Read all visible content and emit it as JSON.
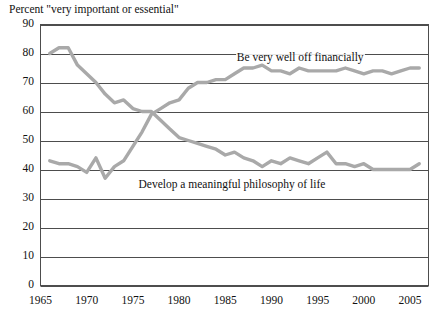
{
  "chart": {
    "title": "Percent \"very important or essential\"",
    "axis": {
      "y_ticks": [
        "0",
        "10",
        "20",
        "30",
        "40",
        "50",
        "60",
        "70",
        "80",
        "90"
      ],
      "x_ticks": [
        "1965",
        "1970",
        "1975",
        "1980",
        "1985",
        "1990",
        "1995",
        "2000",
        "2005"
      ]
    },
    "labels": {
      "financial": "Be very well off financially",
      "philosophy": "Develop a meaningful philosophy of life"
    },
    "colors": {
      "line": "#a9a9a9",
      "grid": "#4d4d4d",
      "border": "#4d4d4d",
      "text": "#111111",
      "background": "#ffffff"
    }
  },
  "chart_data": {
    "type": "line",
    "title": "Percent \"very important or essential\"",
    "xlabel": "",
    "ylabel": "",
    "xlim": [
      1965,
      2007
    ],
    "ylim": [
      0,
      90
    ],
    "grid": true,
    "legend": "inline-annotations",
    "x": [
      1966,
      1967,
      1968,
      1969,
      1970,
      1971,
      1972,
      1973,
      1974,
      1975,
      1976,
      1977,
      1978,
      1979,
      1980,
      1981,
      1982,
      1983,
      1984,
      1985,
      1986,
      1987,
      1988,
      1989,
      1990,
      1991,
      1992,
      1993,
      1994,
      1995,
      1996,
      1997,
      1998,
      1999,
      2000,
      2001,
      2002,
      2003,
      2004,
      2005,
      2006
    ],
    "series": [
      {
        "name": "Develop a meaningful philosophy of life",
        "values": [
          80,
          82,
          82,
          76,
          73,
          70,
          66,
          63,
          64,
          61,
          60,
          60,
          57,
          54,
          51,
          50,
          49,
          48,
          47,
          45,
          46,
          44,
          43,
          41,
          43,
          42,
          44,
          43,
          42,
          44,
          46,
          42,
          42,
          41,
          42,
          40,
          40,
          40,
          40,
          40,
          42
        ],
        "color": "#a9a9a9"
      },
      {
        "name": "Be very well off financially",
        "values": [
          43,
          42,
          42,
          41,
          39,
          44,
          37,
          41,
          43,
          48,
          53,
          59,
          61,
          63,
          64,
          68,
          70,
          70,
          71,
          71,
          73,
          75,
          75,
          76,
          74,
          74,
          73,
          75,
          74,
          74,
          74,
          74,
          75,
          74,
          73,
          74,
          74,
          73,
          74,
          75,
          75
        ],
        "color": "#a9a9a9"
      }
    ]
  }
}
